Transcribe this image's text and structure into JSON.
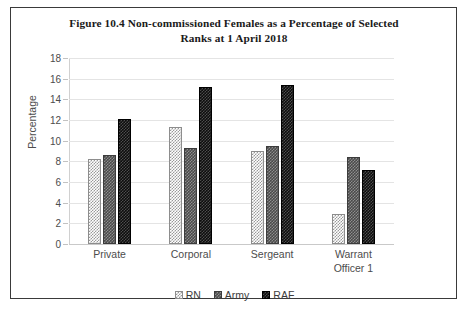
{
  "chart_data": {
    "type": "bar",
    "title": "Figure 10.4 Non-commissioned Females as a Percentage of Selected Ranks at 1 April 2018",
    "title_line1": "Figure 10.4 Non-commissioned Females as a Percentage of Selected",
    "title_line2": "Ranks at 1 April 2018",
    "xlabel": "",
    "ylabel": "Percentage",
    "ylim": [
      0,
      18
    ],
    "ytick_step": 2,
    "yticks": [
      "18",
      "16",
      "14",
      "12",
      "10",
      "8",
      "6",
      "4",
      "2",
      "0"
    ],
    "grid": true,
    "legend_position": "bottom",
    "categories": [
      "Private",
      "Corporal",
      "Sergeant",
      "Warrant Officer 1"
    ],
    "category_labels": [
      {
        "line1": "Private",
        "line2": ""
      },
      {
        "line1": "Corporal",
        "line2": ""
      },
      {
        "line1": "Sergeant",
        "line2": ""
      },
      {
        "line1": "Warrant",
        "line2": "Officer 1"
      }
    ],
    "series": [
      {
        "name": "RN",
        "color": "#ffffff",
        "pattern": "light-check",
        "values": [
          8.2,
          11.3,
          9.0,
          2.9
        ]
      },
      {
        "name": "Army",
        "color": "#4a4a4a",
        "pattern": "dark-check",
        "values": [
          8.6,
          9.3,
          9.5,
          8.4
        ]
      },
      {
        "name": "RAF",
        "color": "#0d0d0d",
        "pattern": "black-check",
        "values": [
          12.1,
          15.2,
          15.4,
          7.2
        ]
      }
    ]
  },
  "legend": {
    "items": [
      {
        "label": "RN"
      },
      {
        "label": "Army"
      },
      {
        "label": "RAF"
      }
    ]
  }
}
